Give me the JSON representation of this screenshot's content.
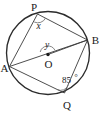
{
  "figure": {
    "background_color": "#ffffff",
    "stroke_color": "#2b2b2b",
    "chord_color": "#3a3a3a",
    "mark_color": "#6e6e6e"
  },
  "labels": {
    "point_p": "P",
    "point_a": "A",
    "point_b": "B",
    "point_q": "Q",
    "point_o": "O",
    "angle_x": "x",
    "angle_y": "y",
    "angle_q": "85",
    "degree_symbol": "°"
  },
  "geometry": {
    "circle": {
      "cx": 48,
      "cy": 53,
      "r": 41.5
    },
    "points": {
      "P": {
        "x": 37.5,
        "y": 14.0
      },
      "B": {
        "x": 87.5,
        "y": 40.0
      },
      "Q": {
        "x": 64.5,
        "y": 93.0
      },
      "A": {
        "x": 9.5,
        "y": 66.5
      },
      "O": {
        "x": 48.0,
        "y": 54.5
      }
    },
    "segments": [
      {
        "name": "PA",
        "from": "P",
        "to": "A"
      },
      {
        "name": "PB",
        "from": "P",
        "to": "B"
      },
      {
        "name": "AB",
        "from": "A",
        "to": "B"
      },
      {
        "name": "AQ",
        "from": "A",
        "to": "Q"
      },
      {
        "name": "QB",
        "from": "Q",
        "to": "B"
      },
      {
        "name": "OB",
        "from": "O",
        "to": "B"
      }
    ],
    "angle_marks": [
      {
        "name": "angle-at-P",
        "vertex": "P",
        "label": "x"
      },
      {
        "name": "angle-at-O",
        "vertex": "O",
        "label": "y"
      },
      {
        "name": "angle-at-Q",
        "vertex": "Q",
        "label": "85"
      }
    ]
  }
}
